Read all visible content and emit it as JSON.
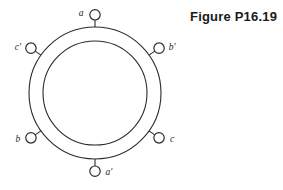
{
  "figure": {
    "caption": "Figure P16.19",
    "geometry": {
      "center_x": 95,
      "center_y": 93,
      "outer_radius": 66,
      "inner_radius": 52,
      "terminal_radius": 5.2,
      "stem_length": 7
    },
    "stroke_color": "#2b2b2b",
    "background_color": "#ffffff",
    "terminals": [
      {
        "id": "a",
        "label": "a",
        "angle_deg": 90,
        "label_dx": -14,
        "label_dy": 1
      },
      {
        "id": "bp",
        "label": "b'",
        "angle_deg": 35,
        "label_dx": 13,
        "label_dy": 2
      },
      {
        "id": "c",
        "label": "c",
        "angle_deg": -35,
        "label_dx": 13,
        "label_dy": 4
      },
      {
        "id": "ap",
        "label": "a'",
        "angle_deg": -90,
        "label_dx": 14,
        "label_dy": 4
      },
      {
        "id": "b",
        "label": "b",
        "angle_deg": 215,
        "label_dx": -13,
        "label_dy": 4
      },
      {
        "id": "cp",
        "label": "c'",
        "angle_deg": 145,
        "label_dx": -13,
        "label_dy": 2
      }
    ]
  }
}
